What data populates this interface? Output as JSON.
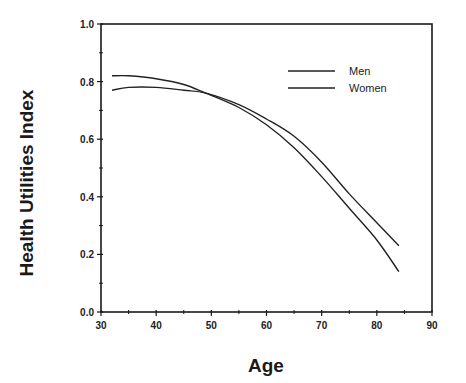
{
  "chart_data": {
    "type": "line",
    "title": "",
    "xlabel": "Age",
    "ylabel": "Health Utilities Index",
    "xlim": [
      30,
      90
    ],
    "ylim": [
      0.0,
      1.0
    ],
    "xticks": [
      "30",
      "40",
      "50",
      "60",
      "70",
      "80",
      "90"
    ],
    "yticks": [
      "0.0",
      "0.2",
      "0.4",
      "0.6",
      "0.8",
      "1.0"
    ],
    "grid": false,
    "legend_position": "upper right (inside)",
    "legend": [
      "Men",
      "Women"
    ],
    "series": [
      {
        "name": "Men",
        "x": [
          32,
          35,
          40,
          45,
          49,
          55,
          60,
          65,
          70,
          75,
          80,
          84
        ],
        "y": [
          0.82,
          0.82,
          0.81,
          0.79,
          0.76,
          0.71,
          0.65,
          0.57,
          0.47,
          0.36,
          0.25,
          0.14
        ]
      },
      {
        "name": "Women",
        "x": [
          32,
          35,
          40,
          45,
          49,
          55,
          60,
          65,
          70,
          75,
          80,
          84
        ],
        "y": [
          0.77,
          0.78,
          0.78,
          0.77,
          0.76,
          0.72,
          0.67,
          0.61,
          0.52,
          0.41,
          0.31,
          0.23
        ]
      }
    ]
  }
}
